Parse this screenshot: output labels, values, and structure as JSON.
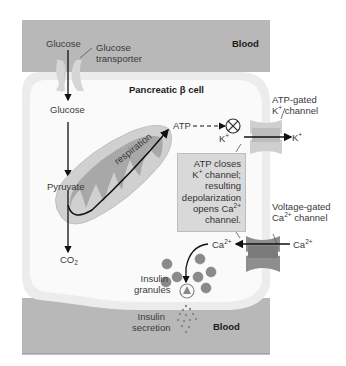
{
  "figure": {
    "cell_label": "Pancreatic β cell",
    "blood_top_label": "Blood",
    "blood_bottom_label": "Blood",
    "glucose_outside": "Glucose",
    "glucose_transporter": [
      "Glucose",
      "transporter"
    ],
    "glucose_inside": "Glucose",
    "pyruvate": "Pyruvate",
    "co2": {
      "base": "CO",
      "sub": "2"
    },
    "respiration": "respiration",
    "atp": "ATP",
    "atp_gated_channel": {
      "line1": "ATP-gated",
      "line2_base": "K",
      "line2_sup": "+",
      "line2_rest": " channel"
    },
    "k_inside": {
      "base": "K",
      "sup": "+"
    },
    "k_outside": {
      "base": "K",
      "sup": "+"
    },
    "info_box": {
      "line1": "ATP closes",
      "line2_base": "K",
      "line2_sup": "+",
      "line2_rest": " channel;",
      "line3": "resulting",
      "line4": "depolarization",
      "line5_base": "opens Ca",
      "line5_sup": "2+",
      "line6": "channel."
    },
    "voltage_gated_channel": {
      "line1": "Voltage-gated",
      "line2_base": "Ca",
      "line2_sup": "2+",
      "line2_rest": " channel"
    },
    "ca_inside": {
      "base": "Ca",
      "sup": "2+"
    },
    "ca_outside": {
      "base": "Ca",
      "sup": "2+"
    },
    "insulin_granules": [
      "Insulin",
      "granules"
    ],
    "insulin_secretion": [
      "Insulin",
      "secretion"
    ]
  },
  "colors": {
    "blood": "#b8b8b8",
    "cell_membrane": "#ececec",
    "cytoplasm": "#fafafa",
    "mitochondrion_outer": "#d0d0d0",
    "mitochondrion_cristae": "#a8a8a8",
    "channel": "#c8c8c8",
    "channel_dark": "#8e8e8e",
    "granule": "#8a8a8a",
    "info_box": "#d9d9d9",
    "arrow": "#111111"
  }
}
